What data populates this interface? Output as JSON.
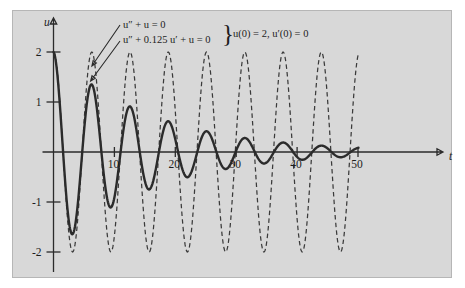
{
  "figure": {
    "background_color": "#ffffff",
    "panel_color": "#d8d8d8",
    "ink_color": "#2b2b2b"
  },
  "annotations": {
    "equation_undamped": "u″ + u = 0",
    "equation_damped": "u″ + 0.125 u′ + u = 0",
    "brace": "}",
    "initial_conditions": "u(0) = 2, u′(0) = 0"
  },
  "chart_data": {
    "type": "line",
    "title": "",
    "xlabel": "t",
    "ylabel": "u",
    "xlim": [
      -1.2,
      53
    ],
    "ylim": [
      -2.45,
      2.45
    ],
    "grid": false,
    "legend_position": "none",
    "xticks": [
      10,
      20,
      30,
      40,
      50
    ],
    "xticklabels": [
      "10",
      "20",
      "30",
      "40",
      "50"
    ],
    "yticks": [
      2,
      1,
      -1,
      -2
    ],
    "yticklabels": [
      "2",
      "1",
      "-1",
      "-2"
    ],
    "series": [
      {
        "name": "u″ + u = 0",
        "style": "dashed",
        "color": "#3a3a3a",
        "formula": "u = 2 cos(t)",
        "amplitude": 2,
        "damping": 0,
        "omega": 1.0,
        "peaks_u": [
          2,
          2,
          2,
          2,
          2,
          2,
          2,
          2,
          2
        ],
        "troughs_u": [
          -2,
          -2,
          -2,
          -2,
          -2,
          -2,
          -2,
          -2
        ]
      },
      {
        "name": "u″ + 0.125 u′ + u = 0",
        "style": "solid",
        "color": "#2b2b2b",
        "formula": "u = 2 e^(-0.0625 t) cos(0.998 t)",
        "amplitude": 2,
        "damping": 0.0625,
        "omega": 0.998045,
        "peaks_t": [
          0,
          6.29,
          12.59,
          18.88,
          25.18,
          31.47,
          37.77,
          44.06
        ],
        "peaks_u": [
          2.0,
          1.35,
          0.91,
          0.61,
          0.42,
          0.28,
          0.19,
          0.13
        ],
        "troughs_t": [
          3.15,
          9.44,
          15.73,
          22.03,
          28.32,
          34.62,
          40.91,
          47.21
        ],
        "troughs_u": [
          -1.64,
          -1.11,
          -0.75,
          -0.5,
          -0.34,
          -0.23,
          -0.16,
          -0.11
        ]
      }
    ],
    "leader_arrows": [
      {
        "label": "equation_undamped",
        "points_to_t": 6.3,
        "points_to_u": 1.72
      },
      {
        "label": "equation_damped",
        "points_to_t": 6.1,
        "points_to_u": 1.42
      }
    ]
  }
}
